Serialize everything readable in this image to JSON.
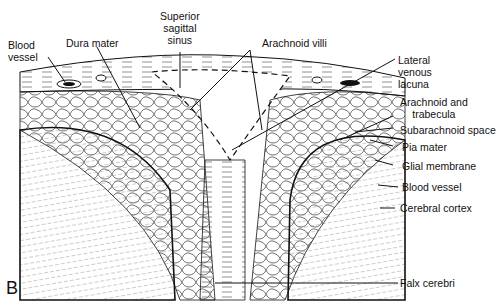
{
  "figure": {
    "panel_letter": "B"
  },
  "labels": {
    "blood_vessel_top": [
      "Blood",
      "vessel"
    ],
    "dura_mater": "Dura mater",
    "superior_sagittal_sinus": [
      "Superior",
      "sagittal",
      "sinus"
    ],
    "arachnoid_villi": "Arachnoid villi",
    "lateral_venous_lacuna": [
      "Lateral",
      "venous",
      "lacuna"
    ],
    "arachnoid_and_trabecula": [
      "Arachnoid and",
      "trabecula"
    ],
    "subarachnoid_space": "Subarachnoid space",
    "pia_mater": "Pia mater",
    "glial_membrane": "Glial membrane",
    "blood_vessel_right": "Blood vessel",
    "cerebral_cortex": "Cerebral cortex",
    "falx_cerebri": "Falx cerebri"
  },
  "colors": {
    "ink": "#111111",
    "paper": "#ffffff"
  }
}
